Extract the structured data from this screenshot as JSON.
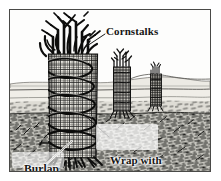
{
  "illustration": {
    "title": "Wrapping shrubs with burlap and cornstalks for winter protection",
    "medium": "pen-and-ink line drawing, black and white",
    "frame": {
      "border_color": "#4a4a48"
    },
    "palette": {
      "ink": "#161616",
      "sky": "#fdfdfc",
      "ground": "#8d8d88",
      "horizon": "#b9b8b2",
      "paper": "#ffffff"
    },
    "labels": [
      {
        "id": "cornstalks",
        "text": "Cornstalks"
      },
      {
        "id": "wrap_line_1",
        "text": "Wrap with"
      },
      {
        "id": "wrap_line_2",
        "text": "heavy twine"
      },
      {
        "id": "burlap",
        "text": "Burlap"
      }
    ],
    "objects": [
      {
        "name": "main-wrapped-shrub",
        "description": "large burlap-wrapped column with spiral twine and cornstalks on top"
      },
      {
        "name": "middle-wrapped-shrub",
        "description": "smaller wrapped column in middle distance"
      },
      {
        "name": "far-wrapped-shrub",
        "description": "smallest wrapped column at right, farthest away"
      },
      {
        "name": "horizon-hills",
        "description": "low distant hills along the horizon"
      },
      {
        "name": "ground-grass",
        "description": "hatched grassy foreground ground"
      }
    ]
  }
}
